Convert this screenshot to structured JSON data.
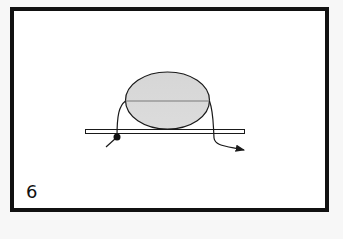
{
  "figure": {
    "step_number": "6",
    "colors": {
      "frame": "#111111",
      "background": "#ffffff",
      "page": "#f7f7f7",
      "oval_fill": "#d9d9d9",
      "stroke": "#1a1a1a",
      "center_line": "#7a7a7a"
    }
  }
}
